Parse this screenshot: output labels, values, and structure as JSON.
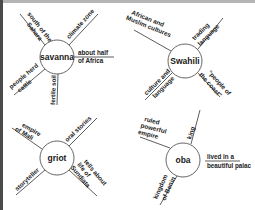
{
  "colors": {
    "background": "#ffffff",
    "ink": "#1a1a1a",
    "top_border": "#b4b4b4",
    "left_border": "#4a4a4a"
  },
  "webs": [
    {
      "center": "savanna",
      "details": {
        "upper_left": [
          "south of the",
          "Sahara"
        ],
        "upper_right": [
          "climate zone"
        ],
        "right": [
          "about half",
          "of Africa"
        ],
        "lower_left": [
          "people herd",
          "cattle"
        ],
        "bottom": [
          "fertile soil"
        ]
      }
    },
    {
      "center": "Swahili",
      "details": {
        "upper_left": [
          "African and",
          "Muslim cultures"
        ],
        "upper_right": [
          "trading",
          "language"
        ],
        "lower_left": [
          "culture and",
          "language"
        ],
        "lower_right": [
          "\"people of",
          "the coast\""
        ]
      }
    },
    {
      "center": "griot",
      "details": {
        "upper_left": [
          "empire",
          "of Mali"
        ],
        "upper_right": [
          "oral stories"
        ],
        "lower_left": [
          "storyteller"
        ],
        "lower_right": [
          "tells about",
          "life of",
          "Sundiata"
        ]
      }
    },
    {
      "center": "oba",
      "details": {
        "upper_left": [
          "ruled",
          "powerful",
          "empire"
        ],
        "top": [
          "king"
        ],
        "right": [
          "lived in a",
          "beautiful palac"
        ],
        "lower_left": [
          "kingdom",
          "of Benin"
        ]
      }
    }
  ]
}
